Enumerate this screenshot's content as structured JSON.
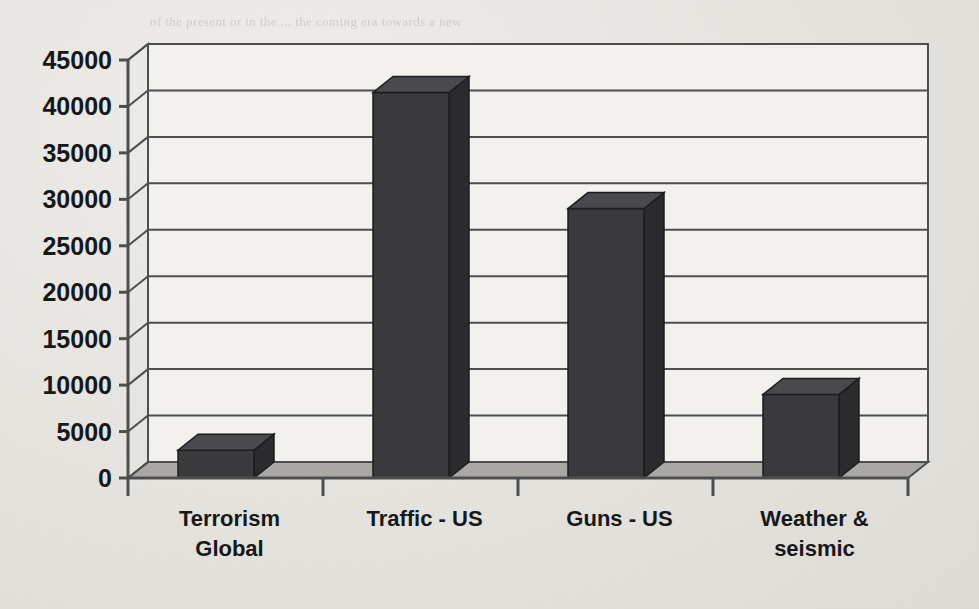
{
  "page": {
    "background_color": "#e6e4df",
    "ghost_text": [
      {
        "text": "of the present or in the ... the coming era towards a new",
        "x": 150,
        "y": 14
      },
      {
        "text": "the world ... and ... blue-sky ... that ... is",
        "x": 560,
        "y": 68
      },
      {
        "text": "only in 1994 the ... its ... becomes ... not at all in",
        "x": 560,
        "y": 88
      },
      {
        "text": "are more ... deeper ... and ...",
        "x": 560,
        "y": 150
      },
      {
        "text": "that ... a ... of ... the ... UN",
        "x": 560,
        "y": 170
      },
      {
        "text": "... ... will also ... of ...",
        "x": 560,
        "y": 230
      },
      {
        "text": "... non-state ... of a ... as a ... in",
        "x": 560,
        "y": 250
      },
      {
        "text": "...",
        "x": 560,
        "y": 290
      }
    ]
  },
  "chart_data": {
    "type": "bar",
    "title": "",
    "xlabel": "",
    "ylabel": "",
    "categories": [
      "Terrorism Global",
      "Traffic - US",
      "Guns - US",
      "Weather & seismic"
    ],
    "category_lines": [
      [
        "Terrorism",
        "Global"
      ],
      [
        "Traffic - US"
      ],
      [
        "Guns - US"
      ],
      [
        "Weather &",
        "seismic"
      ]
    ],
    "values": [
      3000,
      41500,
      29000,
      9000
    ],
    "ylim": [
      0,
      45000
    ],
    "ytick_values": [
      0,
      5000,
      10000,
      15000,
      20000,
      25000,
      30000,
      35000,
      40000,
      45000
    ],
    "ytick_labels": [
      "0",
      "5000",
      "10000",
      "15000",
      "20000",
      "25000",
      "30000",
      "35000",
      "40000",
      "45000"
    ],
    "grid": true,
    "legend": "none",
    "style": "3d-column",
    "bar_color": "#3a3a3c",
    "bar_side_color": "#2b2b2d",
    "bar_top_color": "#4a4a4c",
    "wall_color": "#f2f1ee",
    "floor_color": "#a9a8a4",
    "axis_color": "#4e4e50"
  }
}
